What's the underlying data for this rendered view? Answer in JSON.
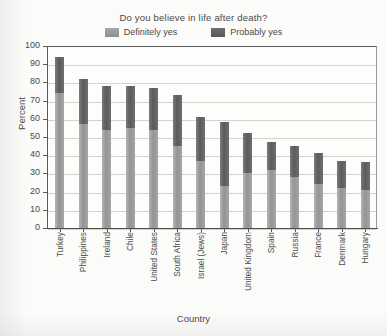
{
  "chart_data": {
    "type": "bar",
    "title": "Do you believe in life after death?",
    "xlabel": "Country",
    "ylabel": "Percent",
    "ylim": [
      0,
      100
    ],
    "ytick_step": 10,
    "yticks": [
      100,
      90,
      80,
      70,
      60,
      50,
      40,
      30,
      20,
      10,
      0
    ],
    "grid": true,
    "stacked": true,
    "legend_position": "top",
    "categories": [
      "Turkey",
      "Philippines",
      "Ireland",
      "Chile",
      "United States",
      "South Africa",
      "Israel (Jews)",
      "Japan",
      "United Kingdom",
      "Spain",
      "Russia",
      "France",
      "Denmark",
      "Hungary"
    ],
    "series": [
      {
        "name": "Definitely yes",
        "color": "#9a9a9a",
        "values": [
          74,
          57,
          54,
          55,
          54,
          45,
          37,
          23,
          30,
          32,
          28,
          24,
          22,
          21
        ]
      },
      {
        "name": "Probably yes",
        "color": "#5f5f5f",
        "values": [
          20,
          25,
          24,
          23,
          23,
          28,
          24,
          35,
          22,
          15,
          17,
          17,
          15,
          15
        ]
      }
    ],
    "totals": [
      94,
      82,
      78,
      78,
      77,
      73,
      61,
      58,
      52,
      47,
      45,
      41,
      37,
      36
    ]
  },
  "legend": {
    "items": [
      {
        "label": "Definitely yes"
      },
      {
        "label": "Probably yes"
      }
    ]
  }
}
